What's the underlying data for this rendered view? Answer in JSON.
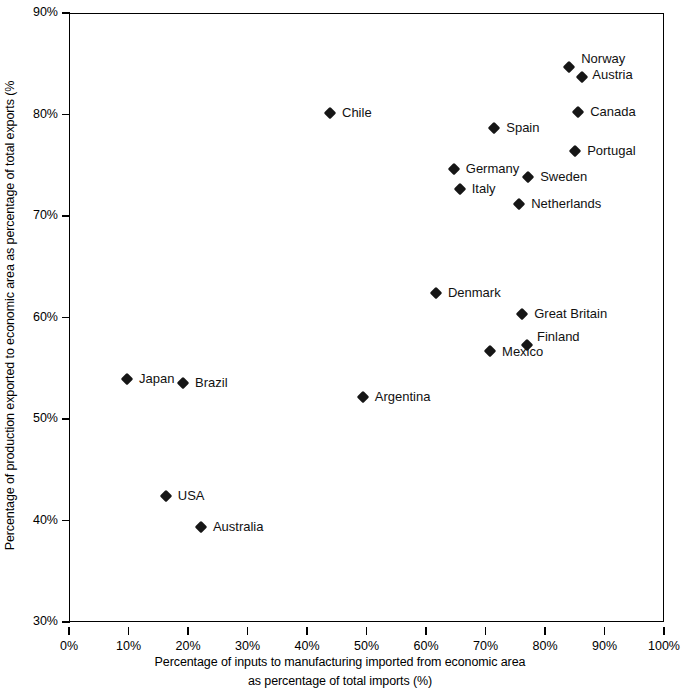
{
  "chart_data": {
    "type": "scatter",
    "title": "",
    "xlabel": "Percentage of inputs to manufacturing imported from economic area as percentage of total imports (%)",
    "xlabel_line1": "Percentage of inputs to manufacturing imported from economic area",
    "xlabel_line2": "as percentage of total imports (%)",
    "ylabel": "Percentage of production exported to economic area as percentage of total exports (%",
    "xlim": [
      0,
      100
    ],
    "ylim": [
      30,
      90
    ],
    "xticks": [
      "0%",
      "10%",
      "20%",
      "30%",
      "40%",
      "50%",
      "60%",
      "70%",
      "80%",
      "90%",
      "100%"
    ],
    "xtick_values": [
      0,
      10,
      20,
      30,
      40,
      50,
      60,
      70,
      80,
      90,
      100
    ],
    "yticks": [
      "30%",
      "40%",
      "50%",
      "60%",
      "70%",
      "80%",
      "90%"
    ],
    "ytick_values": [
      30,
      40,
      50,
      60,
      70,
      80,
      90
    ],
    "grid": false,
    "legend": "none",
    "marker": "diamond",
    "marker_color": "#161616",
    "points": [
      {
        "label": "Norway",
        "x": 83.9,
        "y": 84.8,
        "lx": 12,
        "ly": -15
      },
      {
        "label": "Austria",
        "x": 86.1,
        "y": 83.8,
        "lx": 10,
        "ly": -9
      },
      {
        "label": "Canada",
        "x": 85.4,
        "y": 80.3,
        "lx": 12,
        "ly": -7
      },
      {
        "label": "Chile",
        "x": 43.7,
        "y": 80.2,
        "lx": 12,
        "ly": -7
      },
      {
        "label": "Spain",
        "x": 71.3,
        "y": 78.8,
        "lx": 12,
        "ly": -7
      },
      {
        "label": "Portugal",
        "x": 84.9,
        "y": 76.5,
        "lx": 12,
        "ly": -7
      },
      {
        "label": "Germany",
        "x": 64.5,
        "y": 74.7,
        "lx": 12,
        "ly": -7
      },
      {
        "label": "Sweden",
        "x": 77.0,
        "y": 73.9,
        "lx": 12,
        "ly": -7
      },
      {
        "label": "Italy",
        "x": 65.5,
        "y": 72.8,
        "lx": 12,
        "ly": -7
      },
      {
        "label": "Netherlands",
        "x": 75.5,
        "y": 71.3,
        "lx": 12,
        "ly": -7
      },
      {
        "label": "Denmark",
        "x": 61.5,
        "y": 62.5,
        "lx": 12,
        "ly": -7
      },
      {
        "label": "Great Britain",
        "x": 76.0,
        "y": 60.4,
        "lx": 12,
        "ly": -7
      },
      {
        "label": "Finland",
        "x": 76.8,
        "y": 57.4,
        "lx": 10,
        "ly": -15
      },
      {
        "label": "Mexico",
        "x": 70.6,
        "y": 56.8,
        "lx": 12,
        "ly": -6
      },
      {
        "label": "Japan",
        "x": 9.6,
        "y": 54.0,
        "lx": 12,
        "ly": -7
      },
      {
        "label": "Brazil",
        "x": 19.0,
        "y": 53.6,
        "lx": 12,
        "ly": -7
      },
      {
        "label": "Argentina",
        "x": 49.2,
        "y": 52.3,
        "lx": 12,
        "ly": -7
      },
      {
        "label": "USA",
        "x": 16.1,
        "y": 42.5,
        "lx": 12,
        "ly": -7
      },
      {
        "label": "Australia",
        "x": 22.0,
        "y": 39.5,
        "lx": 12,
        "ly": -7
      }
    ]
  }
}
